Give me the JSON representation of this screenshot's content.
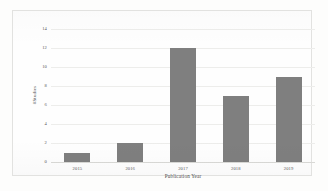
{
  "chart_data": {
    "type": "bar",
    "title": "",
    "subtitle": "",
    "xlabel": "Publication Year",
    "ylabel": "#Studies",
    "categories": [
      "2015",
      "2016",
      "2017",
      "2018",
      "2019"
    ],
    "values": [
      1,
      2,
      12,
      7,
      9
    ],
    "series": [
      {
        "name": "#Studies",
        "values": [
          1,
          2,
          12,
          7,
          9
        ]
      }
    ],
    "ylim": [
      0,
      14
    ],
    "yticks": [
      0,
      2,
      4,
      6,
      8,
      10,
      12,
      14
    ],
    "ytick_labels": [
      "0",
      "2",
      "4",
      "6",
      "8",
      "10",
      "12",
      "14"
    ],
    "grid": true,
    "grid_axis": "y",
    "legend": false,
    "legend_position": "none",
    "bar_color": "#7f7f7f",
    "gridline_color": "#ededeb",
    "axis_text_color": "#59595a",
    "background_color": "#fefefe",
    "border_color": "#e2e2e0"
  }
}
